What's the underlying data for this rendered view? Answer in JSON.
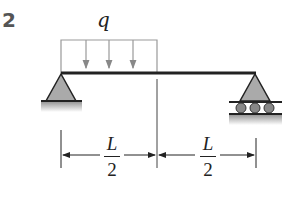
{
  "problem_number": "2",
  "load": {
    "label": "q",
    "type": "uniformly distributed",
    "span": "left half"
  },
  "dimensions": [
    {
      "numerator": "L",
      "denominator": "2"
    },
    {
      "numerator": "L",
      "denominator": "2"
    }
  ],
  "supports": {
    "left": "pin",
    "right": "roller"
  },
  "colors": {
    "line": "#222222",
    "support_fill": "#aaaaaa",
    "load": "#888888"
  }
}
